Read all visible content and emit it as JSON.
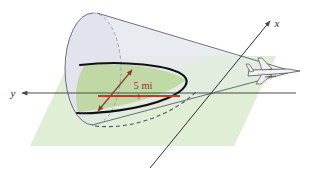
{
  "figure": {
    "caption": ""
  },
  "axes": {
    "y_axis": {
      "label": "y",
      "icon": "axis-arrow-left"
    },
    "x_axis": {
      "label": "x",
      "icon": "axis-arrow-up-right"
    }
  },
  "annotations": {
    "radius": {
      "label": "5 mi",
      "color": "#8c3b2a",
      "arrow": "double-headed"
    }
  },
  "objects": {
    "cone": {
      "name": "shock-wave-cone",
      "fill": "#e6e9ef",
      "stroke": "#5a5f70"
    },
    "ground_plane": {
      "name": "ground-plane",
      "fill": "#dfeed5"
    },
    "intersection_curve": {
      "name": "parabola-curve",
      "stroke": "#111111"
    },
    "airplane": {
      "name": "airplane",
      "fill": "#f2f2f2",
      "stroke": "#3a3a3a"
    }
  },
  "colors": {
    "background": "#ffffff",
    "cone_fill": "#e6e9ef",
    "cone_stroke": "#5a5f70",
    "plane_fill": "#dfeed5",
    "curve_stroke": "#111111",
    "axis_stroke": "#4a4a4a",
    "accent_red": "#c0392b",
    "accent_brown": "#8c3b2a"
  }
}
